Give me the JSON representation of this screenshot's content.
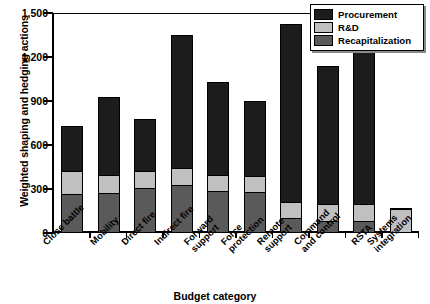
{
  "chart_data": {
    "type": "bar",
    "stacked": true,
    "title": "",
    "xlabel": "Budget category",
    "ylabel": "Weighted shaping and hedging actions",
    "categories": [
      "Close battle",
      "Mobility",
      "Direct fire",
      "Indirect fire",
      "Forward support",
      "Force protection",
      "Remote support",
      "Command and control",
      "RSTA",
      "Systems integration"
    ],
    "yticks": [
      "0",
      "300",
      "600",
      "900",
      "1,200",
      "1,500"
    ],
    "ytick_values": [
      0,
      300,
      600,
      900,
      1200,
      1500
    ],
    "ylim": [
      0,
      1500
    ],
    "grid": false,
    "legend_position": "top-right",
    "series": [
      {
        "name": "Procurement",
        "color": "#1c1c1c",
        "values": [
          300,
          525,
          350,
          900,
          625,
          500,
          1210,
          930,
          1030,
          0
        ]
      },
      {
        "name": "R&D",
        "color": "#c0c0c0",
        "values": [
          150,
          115,
          105,
          105,
          100,
          105,
          100,
          110,
          110,
          150
        ]
      },
      {
        "name": "Recapitalization",
        "color": "#5a5a5a",
        "values": [
          250,
          260,
          295,
          315,
          275,
          265,
          90,
          70,
          70,
          0
        ]
      }
    ],
    "totals": [
      700,
      900,
      750,
      1320,
      1000,
      870,
      1400,
      1110,
      1210,
      150
    ]
  },
  "legend": {
    "items": [
      {
        "label": "Procurement",
        "color": "#1c1c1c"
      },
      {
        "label": "R&D",
        "color": "#c0c0c0"
      },
      {
        "label": "Recapitalization",
        "color": "#5a5a5a"
      }
    ]
  }
}
